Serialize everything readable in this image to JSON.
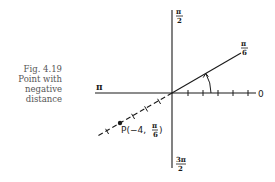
{
  "caption": {
    "figure": "Fig. 4.19",
    "line1": "Point with",
    "line2": "negative",
    "line3": "distance"
  },
  "labels": {
    "angle_pi_over_2": {
      "num": "π",
      "den": "2"
    },
    "angle_pi": "π",
    "angle_zero": "0",
    "angle_3pi_over_2": {
      "num": "3π",
      "den": "2"
    },
    "angle_pi_over_6": {
      "num": "π",
      "den": "6"
    },
    "point": {
      "prefix": "P(−4, ",
      "num": "π",
      "den": "6",
      "suffix": ")"
    }
  },
  "geometry": {
    "origin": [
      172,
      93
    ],
    "polar_axis_ticks": 5,
    "ray_angle": "π/6",
    "point_r": -4
  },
  "colors": {
    "ink": "#1a1a1a",
    "caption": "#555555",
    "background": "#ffffff"
  }
}
